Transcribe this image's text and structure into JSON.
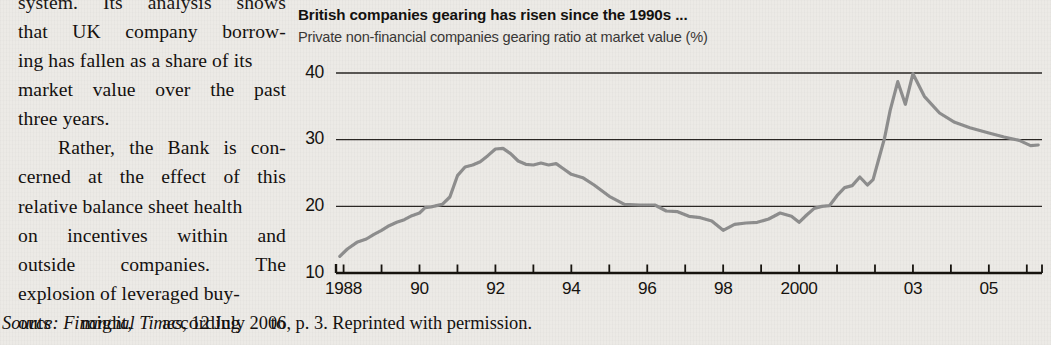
{
  "page": {
    "background_color": "#eceae6",
    "body_text_color": "#14110f"
  },
  "text_column": {
    "lines": [
      {
        "words": [
          "system.",
          "Its",
          "analysis",
          "shows"
        ],
        "justify": true,
        "clipped_top": true
      },
      {
        "words": [
          "that",
          "UK",
          "company",
          "borrow-"
        ],
        "justify": true
      },
      {
        "words": [
          "ing has fallen as a share of its"
        ],
        "justify": false
      },
      {
        "words": [
          "market",
          "value",
          "over",
          "the",
          "past"
        ],
        "justify": true
      },
      {
        "words": [
          "three years."
        ],
        "justify": false
      },
      {
        "words": [
          "Rather,",
          "the",
          "Bank",
          "is",
          "con-"
        ],
        "justify": true,
        "indent": true
      },
      {
        "words": [
          "cerned",
          "at",
          "the",
          "effect",
          "of",
          "this"
        ],
        "justify": true
      },
      {
        "words": [
          "relative balance sheet health"
        ],
        "justify": false
      },
      {
        "words": [
          "on",
          "incentives",
          "within",
          "and"
        ],
        "justify": true
      },
      {
        "words": [
          "outside",
          "companies.",
          "The"
        ],
        "justify": true
      },
      {
        "words": [
          "explosion of leveraged buy-"
        ],
        "justify": false
      },
      {
        "words": [
          "outs",
          "might,",
          "according",
          "to"
        ],
        "justify": true
      }
    ]
  },
  "chart": {
    "title": "British companies  gearing has risen since the 1990s ...",
    "subtitle": "Private non-financial companies gearing ratio at market value (%)",
    "line_color": "#8e8e8e",
    "gridline_color": "#2a2724",
    "axis_color": "#17140f"
  },
  "source": {
    "label": "Source:",
    "publication": "Financial Times",
    "rest": ", 12 July 2006, p. 3. Reprinted with permission."
  },
  "chart_data": {
    "type": "line",
    "title": "British companies  gearing has risen since the 1990s ...",
    "subtitle": "Private non-financial companies gearing ratio at market value (%)",
    "xlabel": "",
    "ylabel": "Gearing ratio at market value (%)",
    "ylim": [
      10,
      40
    ],
    "yticks": [
      10,
      20,
      30,
      40
    ],
    "ytick_labels": [
      "10",
      "20",
      "30",
      "40"
    ],
    "xlim": [
      1987.8,
      2006.4
    ],
    "xticks": [
      1988,
      1990,
      1992,
      1994,
      1996,
      1998,
      2000,
      2003,
      2005
    ],
    "xtick_labels": [
      "1988",
      "90",
      "92",
      "94",
      "96",
      "98",
      "2000",
      "03",
      "05"
    ],
    "minor_tick_interval_years": 1,
    "grid": "horizontal-only",
    "legend": "none",
    "series": [
      {
        "name": "Private non-financial companies gearing ratio at market value (%)",
        "color": "#8e8e8e",
        "x": [
          1987.9,
          1988.1,
          1988.35,
          1988.6,
          1988.8,
          1989.0,
          1989.2,
          1989.4,
          1989.6,
          1989.8,
          1990.0,
          1990.15,
          1990.3,
          1990.45,
          1990.6,
          1990.8,
          1991.0,
          1991.2,
          1991.4,
          1991.6,
          1991.8,
          1992.0,
          1992.2,
          1992.4,
          1992.6,
          1992.8,
          1993.0,
          1993.2,
          1993.4,
          1993.6,
          1993.8,
          1994.0,
          1994.3,
          1994.6,
          1995.0,
          1995.4,
          1995.8,
          1996.0,
          1996.2,
          1996.5,
          1996.8,
          1997.1,
          1997.4,
          1997.7,
          1998.0,
          1998.3,
          1998.6,
          1998.9,
          1999.2,
          1999.5,
          1999.8,
          2000.0,
          2000.2,
          2000.4,
          2000.6,
          2000.8,
          2001.0,
          2001.2,
          2001.4,
          2001.6,
          2001.8,
          2001.95,
          2002.1,
          2002.25,
          2002.4,
          2002.6,
          2002.8,
          2003.0,
          2003.3,
          2003.7,
          2004.1,
          2004.5,
          2005.0,
          2005.4,
          2005.8,
          2006.1,
          2006.3
        ],
        "y": [
          12.5,
          13.6,
          14.6,
          15.1,
          15.8,
          16.4,
          17.1,
          17.6,
          18.0,
          18.6,
          19.0,
          19.8,
          19.9,
          20.1,
          20.3,
          21.4,
          24.6,
          25.9,
          26.2,
          26.7,
          27.6,
          28.6,
          28.7,
          27.9,
          26.8,
          26.3,
          26.2,
          26.5,
          26.2,
          26.4,
          25.6,
          24.8,
          24.3,
          23.2,
          21.5,
          20.3,
          20.2,
          20.2,
          20.2,
          19.3,
          19.2,
          18.5,
          18.3,
          17.8,
          16.4,
          17.3,
          17.5,
          17.6,
          18.1,
          19.0,
          18.5,
          17.6,
          18.7,
          19.7,
          20.0,
          20.1,
          21.6,
          22.8,
          23.1,
          24.4,
          23.2,
          24.0,
          27.1,
          30.2,
          34.4,
          38.7,
          35.3,
          39.9,
          36.5,
          34.0,
          32.6,
          31.8,
          31.0,
          30.4,
          29.9,
          29.1,
          29.2
        ]
      }
    ],
    "annotations": [
      {
        "text": "peak near 40 in 2002-03",
        "x": 2003.0,
        "y": 39.9
      },
      {
        "text": "trough near 16 in 1998",
        "x": 1998.0,
        "y": 16.4
      },
      {
        "text": "series begins near 12.5 in 1988",
        "x": 1987.9,
        "y": 12.5
      }
    ]
  }
}
